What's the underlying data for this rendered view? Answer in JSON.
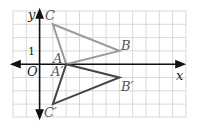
{
  "diagram": {
    "type": "coordinate-plane-reflection",
    "axes": {
      "x_label": "x",
      "y_label": "y",
      "origin_label": "O",
      "tick_label_y": "1"
    },
    "grid": {
      "x_min": -2,
      "x_max": 11,
      "y_min": -4,
      "y_max": 4
    },
    "triangle_original": {
      "color": "#999999",
      "points": [
        {
          "label": "A",
          "x": 2,
          "y": 0
        },
        {
          "label": "B",
          "x": 6,
          "y": 1
        },
        {
          "label": "C",
          "x": 1,
          "y": 3
        }
      ]
    },
    "triangle_image": {
      "color": "#444444",
      "points": [
        {
          "label": "A'",
          "x": 2,
          "y": 0
        },
        {
          "label": "B'",
          "x": 6,
          "y": -1
        },
        {
          "label": "C'",
          "x": 1,
          "y": -3
        }
      ]
    },
    "labels": {
      "A": "A",
      "B": "B",
      "C": "C",
      "A_prime": "A′",
      "B_prime": "B′",
      "C_prime": "C′"
    }
  }
}
